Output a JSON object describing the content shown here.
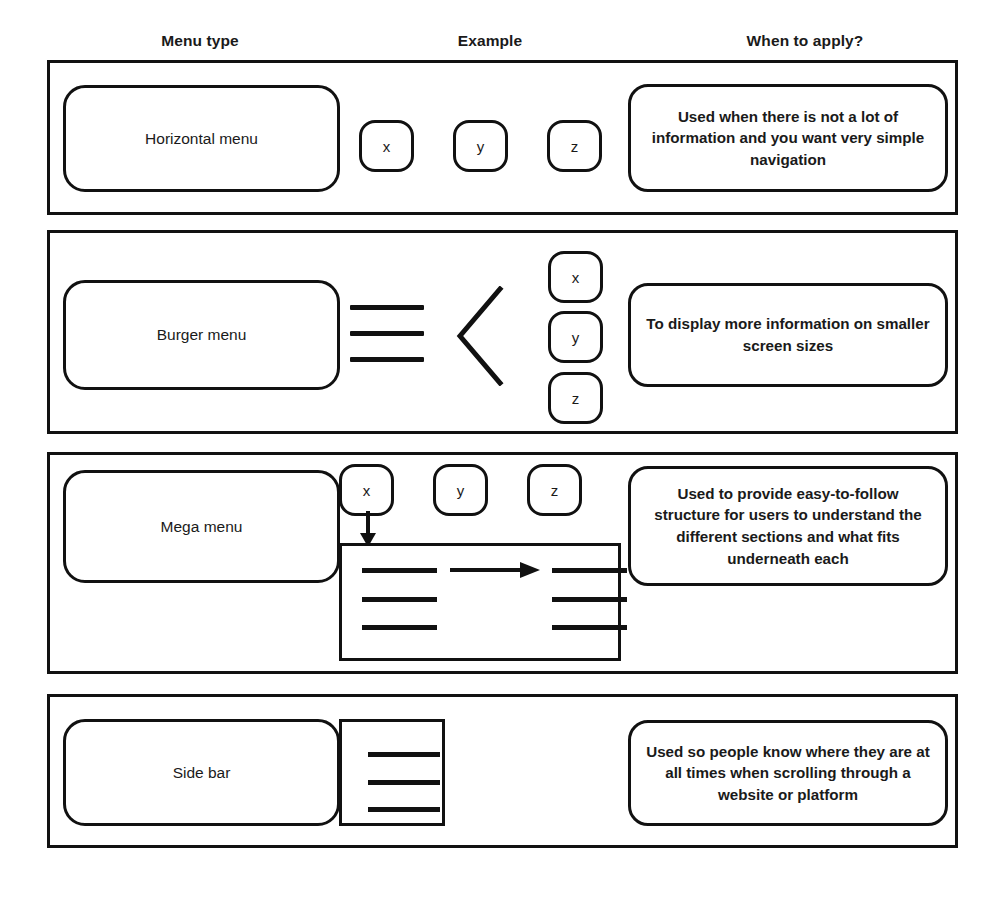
{
  "diagram": {
    "title_headers": [
      {
        "label": "Menu type"
      },
      {
        "label": "Example"
      },
      {
        "label": "When to apply?"
      }
    ],
    "rows": [
      {
        "menu_type": "Horizontal menu",
        "example": {
          "kind": "horizontal-keycaps",
          "keycaps": [
            "x",
            "y",
            "z"
          ]
        },
        "when_to_apply": "Used when there is not a lot of information and you want very simple navigation"
      },
      {
        "menu_type": "Burger menu",
        "example": {
          "kind": "burger-icon-chevron-vertical-keycaps",
          "icons": [
            "hamburger-icon",
            "chevron-left-icon"
          ],
          "keycaps": [
            "x",
            "y",
            "z"
          ]
        },
        "when_to_apply": "To display more information on smaller screen sizes"
      },
      {
        "menu_type": "Mega menu",
        "example": {
          "kind": "horizontal-keycaps-with-dropdown-panel",
          "keycaps": [
            "x",
            "y",
            "z"
          ],
          "icons": [
            "arrow-down-icon",
            "arrow-right-icon"
          ],
          "panel_lines_left": 3,
          "panel_lines_right": 3
        },
        "when_to_apply": "Used to provide easy-to-follow structure for users to understand the different sections and what fits underneath each"
      },
      {
        "menu_type": "Side bar",
        "example": {
          "kind": "sidebar-panel",
          "panel_lines": 3
        },
        "when_to_apply": "Used so people know where they are at all times when scrolling through a website or platform"
      }
    ]
  },
  "colors": {
    "stroke": "#111111",
    "background": "#ffffff",
    "text": "#1a1a1a"
  }
}
